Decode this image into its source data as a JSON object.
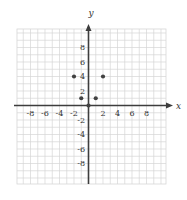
{
  "chart_data": {
    "type": "scatter",
    "title": "",
    "xlabel": "x",
    "ylabel": "y",
    "x_ticks": [
      -8,
      -6,
      -4,
      -2,
      2,
      4,
      6,
      8
    ],
    "y_ticks": [
      8,
      6,
      4,
      2,
      -2,
      -4,
      -6,
      -8
    ],
    "xlim": [
      -10,
      10
    ],
    "ylim": [
      -10,
      10
    ],
    "grid": true,
    "legend": null,
    "points": [
      {
        "x": -2,
        "y": 4
      },
      {
        "x": -1,
        "y": 1
      },
      {
        "x": 0,
        "y": 0
      },
      {
        "x": 1,
        "y": 1
      },
      {
        "x": 2,
        "y": 4
      }
    ]
  },
  "style": {
    "background": "#ffffff",
    "grid_color": "#d6d6d6",
    "axis_color": "#3d3d3d",
    "point_color": "#424242",
    "label_color": "#333333"
  }
}
